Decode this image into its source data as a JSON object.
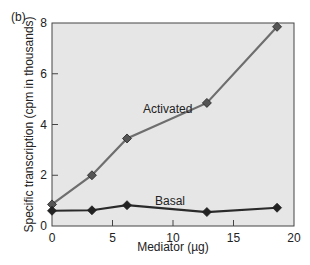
{
  "panel_label": "(b)",
  "chart_data": {
    "type": "line",
    "title": "",
    "xlabel": "Mediator (µg)",
    "ylabel": "Specific transcription (cpm in thousands)",
    "xlim": [
      0,
      20
    ],
    "ylim": [
      0,
      8
    ],
    "xticks": [
      0,
      5,
      10,
      15,
      20
    ],
    "yticks": [
      0,
      2,
      4,
      6,
      8
    ],
    "grid": false,
    "legend": "inline labels",
    "series": [
      {
        "name": "Activated",
        "color": "#6e6e6e",
        "x": [
          0,
          3.3,
          6.2,
          12.8,
          18.6
        ],
        "y": [
          0.85,
          2.0,
          3.45,
          4.85,
          7.85
        ]
      },
      {
        "name": "Basal",
        "color": "#2a2a2a",
        "x": [
          0,
          3.3,
          6.2,
          12.8,
          18.6
        ],
        "y": [
          0.6,
          0.62,
          0.82,
          0.55,
          0.72
        ]
      }
    ],
    "background": "#e6e6e6"
  }
}
